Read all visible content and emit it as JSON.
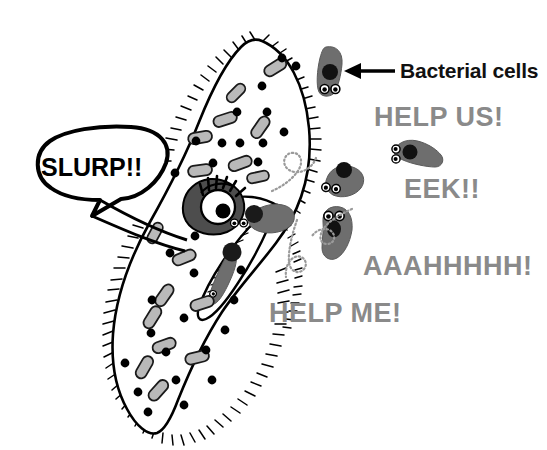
{
  "figure": {
    "kind": "cartoon-biology-diagram",
    "background_color": "#ffffff"
  },
  "annotations": {
    "label": {
      "text": "Bacterial cells",
      "color": "#111111",
      "pointer": "leftward-arrow"
    }
  },
  "speech": {
    "paramecium": {
      "text": "SLURP!!",
      "color": "#000000",
      "style": "speech-bubble"
    },
    "bacteria": [
      {
        "id": "help-us",
        "text": "HELP US!",
        "color": "#8a8a8a"
      },
      {
        "id": "eek",
        "text": "EEK!!",
        "color": "#8a8a8a"
      },
      {
        "id": "aaah",
        "text": "AAAHHHHH!",
        "color": "#8a8a8a"
      },
      {
        "id": "help-me",
        "text": "HELP ME!",
        "color": "#8a8a8a"
      }
    ]
  },
  "organism": {
    "name": "paramecium",
    "outline_color": "#000000",
    "fill_color": "#ffffff",
    "cilia": "hair-fringe",
    "organelle_fill": "#b9b9b9",
    "organelle_stroke": "#1a1a1a",
    "granule_color": "#000000",
    "contractile_vacuole_color": "#4d4d4d",
    "oral_groove": "gullet"
  },
  "bacteria": {
    "body_color": "#6e6e6e",
    "eye_fill": "#ffffff",
    "eye_stroke": "#000000",
    "pupil_color": "#000000",
    "count_free_swimming": 4,
    "count_being_eaten": 2,
    "flagella": "dotted-spiral"
  },
  "colors": {
    "ink": "#000000",
    "gray_text": "#8a8a8a",
    "bacteria_gray": "#6e6e6e",
    "organelle_gray": "#b9b9b9",
    "vacuole_gray": "#4d4d4d"
  }
}
